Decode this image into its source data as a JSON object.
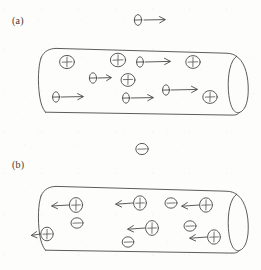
{
  "figure": {
    "type": "hand-drawn-physics-diagram",
    "background_color": "#fdfdfc",
    "ink_color": "#4a4a48",
    "panels": [
      {
        "id": "a",
        "label": "(a)",
        "label_x": 12,
        "label_y": 15,
        "description": "Cylindrical conductor with electrons drifting to the right and stationary positive ions",
        "external_carrier": {
          "kind": "electron",
          "glyph": "minus-oval",
          "x": 138,
          "y": 20,
          "arrow": "right",
          "arrow_length": 26
        },
        "tube": {
          "x": 38,
          "y": 48,
          "width": 208,
          "height": 62,
          "cap": "right-ellipse"
        },
        "positive_charges": [
          {
            "x": 67,
            "y": 62
          },
          {
            "x": 118,
            "y": 60
          },
          {
            "x": 193,
            "y": 62
          },
          {
            "x": 128,
            "y": 80
          },
          {
            "x": 210,
            "y": 97
          }
        ],
        "electrons": [
          {
            "x": 93,
            "y": 78,
            "arrow": "right",
            "arrow_length": 18
          },
          {
            "x": 140,
            "y": 62,
            "arrow": "right",
            "arrow_length": 30
          },
          {
            "x": 56,
            "y": 97,
            "arrow": "right",
            "arrow_length": 26
          },
          {
            "x": 126,
            "y": 98,
            "arrow": "right",
            "arrow_length": 26
          },
          {
            "x": 166,
            "y": 90,
            "arrow": "right",
            "arrow_length": 30
          }
        ]
      },
      {
        "id": "b",
        "label": "(b)",
        "label_x": 12,
        "label_y": 159,
        "description": "Cylindrical conductor with positive charges drifting to the left and stationary negative charges",
        "external_carrier": {
          "kind": "negative-charge",
          "glyph": "circled-minus",
          "x": 142,
          "y": 149,
          "arrow": "none"
        },
        "tube": {
          "x": 38,
          "y": 186,
          "width": 208,
          "height": 62,
          "cap": "right-ellipse"
        },
        "positive_charges": [
          {
            "x": 76,
            "y": 205,
            "arrow": "left",
            "arrow_length": 24
          },
          {
            "x": 140,
            "y": 203,
            "arrow": "left",
            "arrow_length": 24
          },
          {
            "x": 206,
            "y": 205,
            "arrow": "left",
            "arrow_length": 24
          },
          {
            "x": 47,
            "y": 234,
            "arrow": "left",
            "arrow_length": 14
          },
          {
            "x": 152,
            "y": 228,
            "arrow": "left",
            "arrow_length": 24
          },
          {
            "x": 214,
            "y": 237,
            "arrow": "left",
            "arrow_length": 24
          }
        ],
        "negative_charges": [
          {
            "x": 77,
            "y": 223
          },
          {
            "x": 171,
            "y": 203
          },
          {
            "x": 190,
            "y": 226
          },
          {
            "x": 128,
            "y": 242
          }
        ]
      }
    ],
    "legend": {
      "electron_symbol": "oval-with-horizontal-bar",
      "positive_symbol": "circle-with-plus",
      "negative_symbol": "circle-with-minus"
    }
  }
}
